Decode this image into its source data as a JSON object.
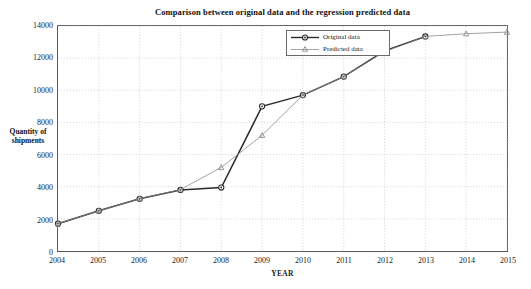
{
  "chart_data": {
    "type": "line",
    "title": "Comparison between original data and the regression predicted data",
    "xlabel": "YEAR",
    "ylabel_line1": "Quantity of",
    "ylabel_line2": "shipments",
    "x": [
      2004,
      2005,
      2006,
      2007,
      2008,
      2009,
      2010,
      2011,
      2012,
      2013,
      2014,
      2015
    ],
    "xtick_labels": [
      "2004",
      "2005",
      "2006",
      "2007",
      "2008",
      "2009",
      "2010",
      "2011",
      "2012",
      "2013",
      "2014",
      "2015"
    ],
    "ytick_labels": [
      "0",
      "2000",
      "4000",
      "6000",
      "8000",
      "10000",
      "12000",
      "14000"
    ],
    "yticks": [
      0,
      2000,
      4000,
      6000,
      8000,
      10000,
      12000,
      14000
    ],
    "xlim": [
      2004,
      2015
    ],
    "ylim": [
      0,
      14000
    ],
    "grid": true,
    "grid_style": "dotted",
    "legend_position": "top-center-right",
    "series": [
      {
        "name": "Original data",
        "marker": "circle",
        "color": "#2b2b2b",
        "x": [
          2004,
          2005,
          2006,
          2007,
          2008,
          2009,
          2010,
          2011,
          2012,
          2013
        ],
        "values": [
          1700,
          2500,
          3250,
          3800,
          3950,
          9000,
          9700,
          10850,
          12450,
          13350
        ]
      },
      {
        "name": "Predicted data",
        "marker": "triangle",
        "color": "#8a8a8a",
        "x": [
          2004,
          2005,
          2006,
          2007,
          2008,
          2009,
          2010,
          2011,
          2012,
          2013,
          2014,
          2015
        ],
        "values": [
          1700,
          2500,
          3250,
          3820,
          5200,
          7200,
          9700,
          10850,
          12400,
          13350,
          13520,
          13620
        ]
      }
    ]
  },
  "legend": {
    "entries": [
      {
        "label": "Original data"
      },
      {
        "label": "Predicted data"
      }
    ]
  },
  "colors": {
    "original": "#2b2b2b",
    "predicted": "#8a8a8a",
    "grid": "#c9c9c9",
    "axis": "#5a5a5a",
    "background": "#ffffff"
  }
}
